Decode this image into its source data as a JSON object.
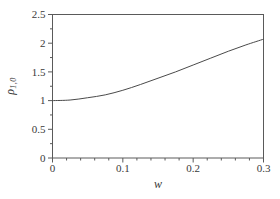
{
  "figure": {
    "background": "#ffffff",
    "frame_color": "#5a5a5a",
    "tick_color": "#5a5a5a",
    "text_color": "#3a3a3a",
    "curve_color": "#4a4a4a"
  },
  "chart_data": {
    "type": "line",
    "title": "",
    "xlabel": "w",
    "ylabel": "ρ_{1,0}",
    "ylabel_base": "ρ",
    "ylabel_sub": "1,0",
    "xlim": [
      0,
      0.3
    ],
    "ylim": [
      0,
      2.5
    ],
    "xticks": [
      0,
      0.1,
      0.2,
      0.3
    ],
    "xtick_labels": [
      "0",
      "0.1",
      "0.2",
      "0.3"
    ],
    "yticks": [
      0,
      0.5,
      1,
      1.5,
      2,
      2.5
    ],
    "ytick_labels": [
      "0",
      "0.5",
      "1",
      "1.5",
      "2",
      "2.5"
    ],
    "x_minor_step": 0.02,
    "y_minor_step": 0.25,
    "grid": false,
    "legend": null,
    "frame": true,
    "series": [
      {
        "name": "rho_1_0",
        "x": [
          0,
          0.025,
          0.05,
          0.075,
          0.1,
          0.125,
          0.15,
          0.175,
          0.2,
          0.225,
          0.25,
          0.275,
          0.3
        ],
        "y": [
          1.0,
          1.01,
          1.05,
          1.1,
          1.18,
          1.28,
          1.39,
          1.5,
          1.62,
          1.74,
          1.86,
          1.97,
          2.07
        ]
      }
    ]
  }
}
